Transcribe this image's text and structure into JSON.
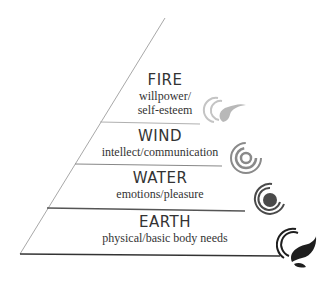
{
  "diagram": {
    "type": "pyramid",
    "tiers": [
      {
        "title": "FIRE",
        "subtitle_lines": [
          "willpower/",
          "self-esteem"
        ],
        "icon": "fire-swirl-icon",
        "color": "#b8b8b8"
      },
      {
        "title": "WIND",
        "subtitle_lines": [
          "intellect/communication"
        ],
        "icon": "wind-spiral-icon",
        "color": "#8a8a8a"
      },
      {
        "title": "WATER",
        "subtitle_lines": [
          "emotions/pleasure"
        ],
        "icon": "water-spiral-icon",
        "color": "#4a4a4a"
      },
      {
        "title": "EARTH",
        "subtitle_lines": [
          "physical/basic body needs"
        ],
        "icon": "earth-leaf-icon",
        "color": "#1e1e1e"
      }
    ]
  }
}
